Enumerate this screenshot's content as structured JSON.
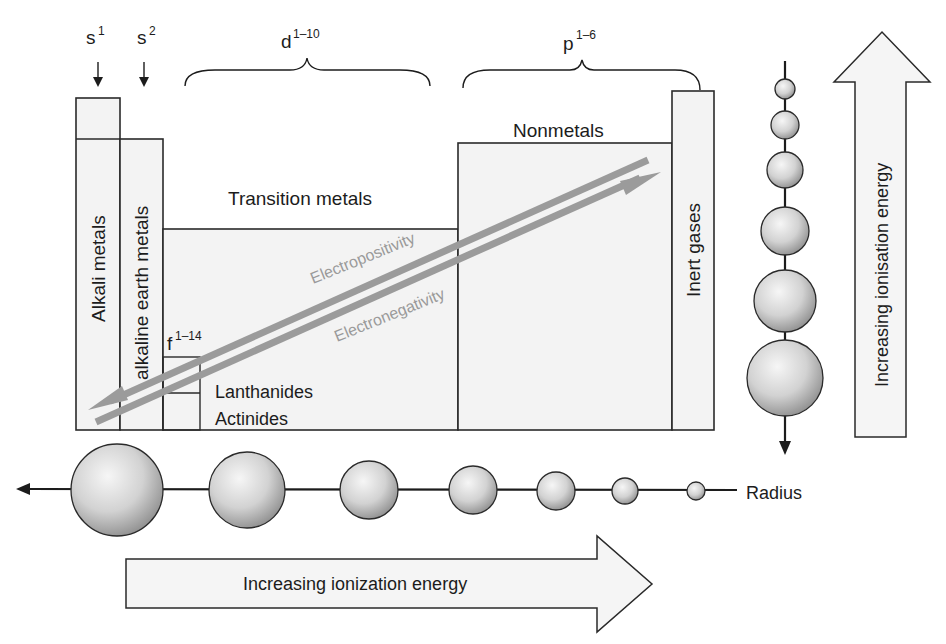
{
  "diagram": {
    "block_labels": {
      "s1": {
        "base": "s",
        "sup": "1"
      },
      "s2": {
        "base": "s",
        "sup": "2"
      },
      "d": {
        "base": "d",
        "sup": "1–10"
      },
      "p": {
        "base": "p",
        "sup": "1–6"
      },
      "f": {
        "base": "f",
        "sup": "1–14"
      }
    },
    "groups": {
      "alkali": "Alkali metals",
      "alkaline_earth": "alkaline earth metals",
      "transition": "Transition metals",
      "nonmetals": "Nonmetals",
      "inert": "Inert gases",
      "lanthanides": "Lanthanides",
      "actinides": "Actinides"
    },
    "trend_arrows": {
      "electropositivity": "Electropositivity",
      "electronegativity": "Electronegativity",
      "arrow_color": "#9b9b9b"
    },
    "radius_label": "Radius",
    "horizontal_arrow_label": "Increasing ionization energy",
    "vertical_arrow_label": "Increasing ionisation energy",
    "horizontal_spheres": [
      46,
      38,
      29,
      24,
      20,
      14,
      9
    ],
    "vertical_spheres": [
      10,
      13,
      17,
      24,
      30,
      38
    ],
    "colors": {
      "box_fill": "#f3f3f3",
      "stroke": "#2a2a2a",
      "sphere_light": "#f4f4f4",
      "sphere_dark": "#8c8c8c"
    }
  }
}
